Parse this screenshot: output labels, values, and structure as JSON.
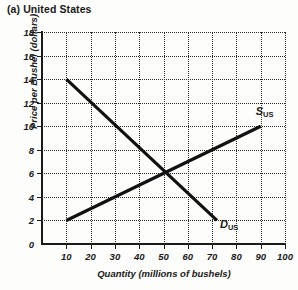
{
  "chart_data": {
    "type": "line",
    "title": "(a) United States",
    "xlabel": "Quantity (millions of bushels)",
    "ylabel": "Price per Bushel (dollars)",
    "xlim": [
      0,
      100
    ],
    "ylim": [
      0,
      18
    ],
    "grid": true,
    "legend_position": "inline-at-curve-end",
    "xticks": [
      10,
      20,
      30,
      40,
      50,
      60,
      70,
      80,
      90,
      100
    ],
    "yticks": [
      0,
      2,
      4,
      6,
      8,
      10,
      12,
      14,
      16,
      18
    ],
    "origin_label": "0",
    "series": [
      {
        "name": "S_US",
        "label_text": "S",
        "label_sub": "US",
        "description": "United States supply curve, upward sloping",
        "points": [
          [
            10,
            2
          ],
          [
            90,
            10
          ]
        ]
      },
      {
        "name": "D_US",
        "label_text": "D",
        "label_sub": "US",
        "description": "United States demand curve, downward sloping",
        "points": [
          [
            10,
            14
          ],
          [
            72,
            2
          ]
        ]
      }
    ],
    "equilibrium": {
      "quantity": 50,
      "price": 6
    },
    "colors": {
      "background": "#fdfdfb",
      "ink": "#1a1a1a",
      "gridline": "#2a2a2a",
      "curve": "#111111"
    }
  }
}
